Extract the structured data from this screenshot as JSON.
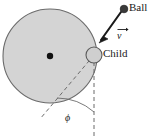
{
  "figure": {
    "labels": {
      "ball": "Ball",
      "child": "Child",
      "velocity": "v",
      "angle": "ϕ"
    },
    "colors": {
      "disk_fill": "#d4d4d4",
      "disk_stroke": "#6b6b6b",
      "child_fill": "#cfcfcf",
      "child_stroke": "#5a5a5a",
      "ball_fill": "#3a3a3a",
      "center_dot": "#111111",
      "arrow": "#1a1a1a",
      "dashed": "#6b6b6b",
      "text": "#1a1a1a",
      "background": "#ffffff"
    },
    "geometry": {
      "disk_center_x": 50,
      "disk_center_y": 56,
      "disk_radius": 47,
      "child_x": 94,
      "child_y": 55,
      "child_radius": 8,
      "ball_x": 124,
      "ball_y": 9,
      "ball_radius": 3.6,
      "arrow_tip_x": 100,
      "arrow_tip_y": 41,
      "vertical_line_x": 94,
      "vertical_line_bottom": 138,
      "tangent_end_x": 40,
      "tangent_end_y": 119,
      "arc_radius": 42
    },
    "elements": [
      "disk",
      "center-dot",
      "child-marker",
      "ball-marker",
      "velocity-arrow",
      "tangent-dashed-line",
      "vertical-dashed-line",
      "angle-arc"
    ]
  }
}
